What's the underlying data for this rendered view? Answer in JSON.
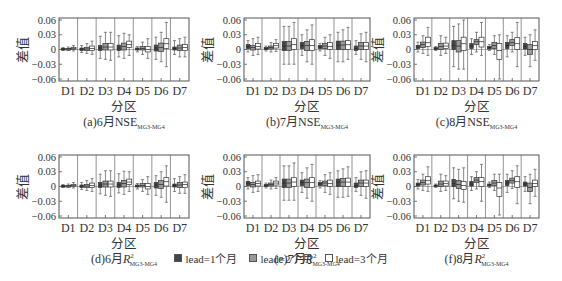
{
  "chart_data": {
    "type": "boxplot",
    "layout": {
      "rows": 2,
      "cols": 3,
      "legend_position": "bottom-center",
      "grid": false
    },
    "shared": {
      "xlabel": "分区",
      "ylabel": "差值",
      "categories": [
        "D1",
        "D2",
        "D3",
        "D4",
        "D5",
        "D6",
        "D7"
      ],
      "ylim": [
        -0.06,
        0.06
      ],
      "yticks": [
        "0.06",
        "0.03",
        "0",
        "-0.03",
        "-0.06"
      ],
      "series_names": [
        "lead=1个月",
        "lead=2个月",
        "lead=3个月"
      ],
      "series_fill": [
        "#444444",
        "#999999",
        "#ffffff"
      ]
    },
    "panels": [
      {
        "id": "a",
        "title_prefix": "(a)6月",
        "metric": "NSE",
        "subscript": "MG3-MG4",
        "boxes": [
          [
            [
              -0.002,
              0,
              0.001,
              0.002,
              0.004
            ],
            [
              -0.002,
              0,
              0.001,
              0.002,
              0.005
            ],
            [
              -0.003,
              0,
              0.002,
              0.004,
              0.008
            ]
          ],
          [
            [
              -0.006,
              -0.002,
              0.001,
              0.003,
              0.008
            ],
            [
              -0.008,
              -0.002,
              0.001,
              0.004,
              0.012
            ],
            [
              -0.01,
              -0.002,
              0.002,
              0.007,
              0.017
            ]
          ],
          [
            [
              -0.018,
              -0.002,
              0.003,
              0.008,
              0.027
            ],
            [
              -0.02,
              -0.001,
              0.005,
              0.012,
              0.035
            ],
            [
              -0.022,
              -0.001,
              0.005,
              0.012,
              0.035
            ]
          ],
          [
            [
              -0.015,
              -0.002,
              0.003,
              0.009,
              0.028
            ],
            [
              -0.018,
              -0.001,
              0.006,
              0.013,
              0.033
            ],
            [
              -0.012,
              0.004,
              0.01,
              0.017,
              0.03
            ]
          ],
          [
            [
              -0.005,
              -0.001,
              0.001,
              0.003,
              0.006
            ],
            [
              -0.01,
              -0.001,
              0.002,
              0.006,
              0.015
            ],
            [
              -0.018,
              -0.005,
              0,
              0.006,
              0.022
            ]
          ],
          [
            [
              -0.02,
              -0.003,
              0.003,
              0.009,
              0.025
            ],
            [
              -0.025,
              -0.004,
              0.004,
              0.013,
              0.035
            ],
            [
              -0.035,
              0.002,
              0.012,
              0.022,
              0.055
            ]
          ],
          [
            [
              -0.01,
              -0.001,
              0.002,
              0.005,
              0.018
            ],
            [
              -0.015,
              -0.002,
              0.003,
              0.009,
              0.022
            ],
            [
              -0.015,
              -0.002,
              0.004,
              0.01,
              0.025
            ]
          ]
        ]
      },
      {
        "id": "b",
        "title_prefix": "(b)7月",
        "metric": "NSE",
        "subscript": "MG3-MG4",
        "boxes": [
          [
            [
              -0.005,
              0.002,
              0.006,
              0.01,
              0.018
            ],
            [
              -0.012,
              -0.001,
              0.004,
              0.008,
              0.022
            ],
            [
              -0.01,
              0.001,
              0.006,
              0.012,
              0.025
            ]
          ],
          [
            [
              -0.003,
              0,
              0.002,
              0.004,
              0.007
            ],
            [
              -0.005,
              0.001,
              0.004,
              0.007,
              0.014
            ],
            [
              -0.004,
              0.003,
              0.008,
              0.012,
              0.02
            ]
          ],
          [
            [
              -0.03,
              -0.002,
              0.007,
              0.016,
              0.047
            ],
            [
              -0.03,
              -0.002,
              0.007,
              0.016,
              0.047
            ],
            [
              -0.03,
              0,
              0.01,
              0.022,
              0.055
            ]
          ],
          [
            [
              -0.012,
              0.002,
              0.008,
              0.014,
              0.03
            ],
            [
              -0.025,
              -0.002,
              0.008,
              0.016,
              0.04
            ],
            [
              -0.03,
              -0.002,
              0.008,
              0.02,
              0.05
            ]
          ],
          [
            [
              -0.003,
              0.002,
              0.005,
              0.008,
              0.012
            ],
            [
              -0.012,
              0.002,
              0.007,
              0.012,
              0.025
            ],
            [
              -0.018,
              0,
              0.006,
              0.014,
              0.03
            ]
          ],
          [
            [
              -0.025,
              0,
              0.009,
              0.017,
              0.035
            ],
            [
              -0.025,
              0,
              0.009,
              0.017,
              0.04
            ],
            [
              -0.02,
              0,
              0.01,
              0.018,
              0.045
            ]
          ],
          [
            [
              -0.01,
              -0.002,
              0.002,
              0.007,
              0.018
            ],
            [
              -0.02,
              0,
              0.007,
              0.014,
              0.032
            ],
            [
              -0.025,
              0,
              0.007,
              0.014,
              0.035
            ]
          ]
        ]
      },
      {
        "id": "c",
        "title_prefix": "(c)8月",
        "metric": "NSE",
        "subscript": "MG3-MG4",
        "boxes": [
          [
            [
              -0.005,
              0.002,
              0.005,
              0.008,
              0.015
            ],
            [
              -0.008,
              0.004,
              0.01,
              0.015,
              0.028
            ],
            [
              -0.012,
              0.006,
              0.014,
              0.025,
              0.045
            ]
          ],
          [
            [
              -0.002,
              0,
              0.002,
              0.004,
              0.006
            ],
            [
              -0.012,
              0,
              0.006,
              0.012,
              0.028
            ],
            [
              -0.008,
              0.002,
              0.007,
              0.013,
              0.025
            ]
          ],
          [
            [
              -0.035,
              0,
              0.008,
              0.018,
              0.047
            ],
            [
              -0.04,
              -0.005,
              0.007,
              0.018,
              0.052
            ],
            [
              -0.04,
              -0.002,
              0.012,
              0.025,
              0.06
            ]
          ],
          [
            [
              -0.01,
              0.002,
              0.007,
              0.012,
              0.022
            ],
            [
              -0.005,
              0.01,
              0.016,
              0.02,
              0.035
            ],
            [
              -0.012,
              0.005,
              0.016,
              0.025,
              0.055
            ]
          ],
          [
            [
              -0.002,
              0.001,
              0.004,
              0.006,
              0.01
            ],
            [
              -0.01,
              0.002,
              0.008,
              0.014,
              0.028
            ],
            [
              -0.06,
              -0.02,
              -0.002,
              0.012,
              0.03
            ]
          ],
          [
            [
              -0.015,
              0.002,
              0.008,
              0.014,
              0.028
            ],
            [
              -0.005,
              0.008,
              0.014,
              0.02,
              0.035
            ],
            [
              -0.035,
              0,
              0.012,
              0.024,
              0.055
            ]
          ],
          [
            [
              -0.012,
              0.001,
              0.006,
              0.012,
              0.025
            ],
            [
              -0.035,
              -0.01,
              0,
              0.01,
              0.03
            ],
            [
              -0.022,
              0,
              0.008,
              0.016,
              0.04
            ]
          ]
        ]
      },
      {
        "id": "d",
        "title_prefix": "(d)6月",
        "metric": "R",
        "metric_sup": "2",
        "subscript": "MG3-MG4",
        "boxes": [
          [
            [
              -0.002,
              0,
              0.001,
              0.002,
              0.004
            ],
            [
              -0.002,
              0,
              0.001,
              0.002,
              0.005
            ],
            [
              -0.003,
              0,
              0.002,
              0.004,
              0.008
            ]
          ],
          [
            [
              -0.006,
              -0.002,
              0.001,
              0.003,
              0.008
            ],
            [
              -0.008,
              -0.002,
              0.001,
              0.004,
              0.012
            ],
            [
              -0.01,
              -0.002,
              0.002,
              0.007,
              0.016
            ]
          ],
          [
            [
              -0.015,
              -0.002,
              0.003,
              0.008,
              0.025
            ],
            [
              -0.018,
              -0.001,
              0.005,
              0.011,
              0.032
            ],
            [
              -0.02,
              -0.001,
              0.005,
              0.011,
              0.032
            ]
          ],
          [
            [
              -0.013,
              -0.002,
              0.003,
              0.008,
              0.026
            ],
            [
              -0.016,
              -0.001,
              0.006,
              0.012,
              0.031
            ],
            [
              -0.01,
              0.004,
              0.009,
              0.015,
              0.03
            ]
          ],
          [
            [
              -0.005,
              -0.001,
              0.001,
              0.003,
              0.006
            ],
            [
              -0.01,
              -0.001,
              0.002,
              0.006,
              0.014
            ],
            [
              -0.016,
              -0.005,
              0,
              0.006,
              0.02
            ]
          ],
          [
            [
              -0.018,
              -0.003,
              0.003,
              0.008,
              0.022
            ],
            [
              -0.022,
              -0.004,
              0.004,
              0.012,
              0.03
            ],
            [
              -0.032,
              0.001,
              0.01,
              0.018,
              0.042
            ]
          ],
          [
            [
              -0.01,
              -0.001,
              0.002,
              0.005,
              0.016
            ],
            [
              -0.014,
              -0.002,
              0.003,
              0.008,
              0.02
            ],
            [
              -0.014,
              -0.002,
              0.004,
              0.009,
              0.024
            ]
          ]
        ]
      },
      {
        "id": "e",
        "title_prefix": "(e)7月",
        "metric": "R",
        "metric_sup": "2",
        "subscript": "MG3-MG4",
        "boxes": [
          [
            [
              -0.005,
              0.002,
              0.006,
              0.01,
              0.018
            ],
            [
              -0.012,
              -0.001,
              0.004,
              0.008,
              0.022
            ],
            [
              -0.01,
              0.001,
              0.006,
              0.011,
              0.024
            ]
          ],
          [
            [
              -0.003,
              0,
              0.002,
              0.004,
              0.007
            ],
            [
              -0.005,
              0.001,
              0.004,
              0.007,
              0.013
            ],
            [
              -0.004,
              0.003,
              0.007,
              0.011,
              0.018
            ]
          ],
          [
            [
              -0.028,
              -0.002,
              0.007,
              0.015,
              0.042
            ],
            [
              -0.028,
              -0.002,
              0.007,
              0.015,
              0.042
            ],
            [
              -0.028,
              0,
              0.009,
              0.018,
              0.048
            ]
          ],
          [
            [
              -0.012,
              0.002,
              0.008,
              0.013,
              0.028
            ],
            [
              -0.024,
              -0.002,
              0.008,
              0.015,
              0.038
            ],
            [
              -0.03,
              -0.002,
              0.008,
              0.018,
              0.045
            ]
          ],
          [
            [
              -0.003,
              0.002,
              0.005,
              0.008,
              0.012
            ],
            [
              -0.012,
              0.002,
              0.007,
              0.011,
              0.024
            ],
            [
              -0.016,
              0,
              0.006,
              0.013,
              0.028
            ]
          ],
          [
            [
              -0.022,
              0,
              0.009,
              0.015,
              0.032
            ],
            [
              -0.022,
              0,
              0.009,
              0.016,
              0.036
            ],
            [
              -0.02,
              0,
              0.009,
              0.017,
              0.04
            ]
          ],
          [
            [
              -0.01,
              -0.002,
              0.002,
              0.007,
              0.018
            ],
            [
              -0.018,
              0,
              0.007,
              0.013,
              0.03
            ],
            [
              -0.024,
              0,
              0.007,
              0.013,
              0.032
            ]
          ]
        ]
      },
      {
        "id": "f",
        "title_prefix": "(f)8月",
        "metric": "R",
        "metric_sup": "2",
        "subscript": "MG3-MG4",
        "boxes": [
          [
            [
              -0.005,
              0.001,
              0.004,
              0.007,
              0.014
            ],
            [
              -0.008,
              0.003,
              0.008,
              0.013,
              0.025
            ],
            [
              -0.01,
              0.005,
              0.012,
              0.02,
              0.04
            ]
          ],
          [
            [
              -0.002,
              0,
              0.002,
              0.003,
              0.005
            ],
            [
              -0.01,
              0,
              0.005,
              0.011,
              0.025
            ],
            [
              -0.008,
              0.001,
              0.006,
              0.011,
              0.022
            ]
          ],
          [
            [
              -0.025,
              0,
              0.006,
              0.014,
              0.038
            ],
            [
              -0.03,
              -0.004,
              0.004,
              0.012,
              0.035
            ],
            [
              -0.032,
              -0.006,
              0.002,
              0.01,
              0.038
            ]
          ],
          [
            [
              -0.008,
              0.001,
              0.005,
              0.01,
              0.02
            ],
            [
              -0.005,
              0.008,
              0.013,
              0.018,
              0.03
            ],
            [
              -0.03,
              0,
              0.01,
              0.018,
              0.045
            ]
          ],
          [
            [
              -0.002,
              0.001,
              0.003,
              0.005,
              0.009
            ],
            [
              -0.008,
              0.002,
              0.007,
              0.012,
              0.025
            ],
            [
              -0.058,
              -0.02,
              -0.003,
              0.008,
              0.025
            ]
          ],
          [
            [
              -0.012,
              0.002,
              0.007,
              0.012,
              0.025
            ],
            [
              -0.004,
              0.007,
              0.012,
              0.017,
              0.032
            ],
            [
              -0.035,
              -0.002,
              0.01,
              0.02,
              0.042
            ]
          ],
          [
            [
              -0.01,
              0.001,
              0.005,
              0.009,
              0.02
            ],
            [
              -0.035,
              -0.01,
              -0.002,
              0.007,
              0.025
            ],
            [
              -0.02,
              0,
              0.006,
              0.013,
              0.035
            ]
          ]
        ]
      }
    ],
    "box_format": "[whisker_low, q1, median, q3, whisker_high] per series per category"
  },
  "legend": {
    "items": [
      {
        "label": "lead=1个月",
        "color": "#444444"
      },
      {
        "label": "lead=2个月",
        "color": "#999999"
      },
      {
        "label": "lead=3个月",
        "color": "#ffffff"
      }
    ]
  }
}
